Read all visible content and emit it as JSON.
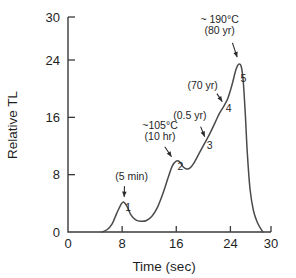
{
  "chart_data": {
    "type": "line",
    "title": "",
    "xlabel": "Time (sec)",
    "ylabel": "Relative TL",
    "xlim": [
      0,
      30
    ],
    "ylim": [
      0,
      30
    ],
    "xticks": [
      0,
      8,
      16,
      24,
      30
    ],
    "yticks": [
      0,
      8,
      16,
      24,
      30
    ],
    "xtick_labels": [
      "0",
      "8",
      "16",
      "24",
      "30"
    ],
    "ytick_labels": [
      "0",
      "8",
      "16",
      "24",
      "30"
    ],
    "grid": false,
    "legend": "none",
    "series": [
      {
        "name": "glow-curve",
        "x": [
          5.0,
          5.8,
          6.5,
          7.2,
          7.8,
          8.2,
          8.7,
          9.3,
          10.0,
          10.8,
          11.6,
          12.4,
          13.2,
          14.0,
          14.8,
          15.4,
          16.0,
          16.5,
          17.0,
          17.5,
          18.0,
          18.6,
          19.4,
          20.2,
          21.0,
          21.8,
          22.4,
          23.0,
          23.6,
          24.2,
          24.8,
          25.2,
          25.6,
          25.9,
          26.2,
          26.5,
          26.9,
          27.4,
          28.0,
          28.8
        ],
        "y": [
          0.0,
          0.35,
          1.1,
          2.6,
          3.8,
          4.2,
          3.6,
          2.4,
          1.7,
          1.5,
          1.6,
          2.2,
          3.4,
          5.3,
          7.6,
          9.2,
          9.9,
          9.8,
          9.1,
          8.8,
          8.9,
          9.6,
          11.0,
          12.4,
          13.8,
          15.4,
          16.6,
          17.5,
          18.6,
          20.4,
          22.6,
          23.4,
          23.1,
          21.0,
          16.5,
          11.0,
          6.0,
          3.0,
          1.3,
          0.0
        ]
      }
    ],
    "peaks": [
      {
        "id": "1",
        "label": "1",
        "x": 8.2,
        "y": 4.2,
        "label_x": 8.45,
        "label_y": 2.9
      },
      {
        "id": "2",
        "label": "2",
        "x": 16.0,
        "y": 9.9,
        "label_x": 16.2,
        "label_y": 8.6
      },
      {
        "id": "3",
        "label": "3",
        "x": 20.2,
        "y": 12.4,
        "label_x": 20.5,
        "label_y": 11.6
      },
      {
        "id": "4",
        "label": "4",
        "x": 23.0,
        "y": 17.5,
        "label_x": 23.3,
        "label_y": 16.7
      },
      {
        "id": "5",
        "label": "5",
        "x": 25.2,
        "y": 23.4,
        "label_x": 25.5,
        "label_y": 21.0
      }
    ],
    "annotations": [
      {
        "id": "peak1-annotation",
        "lines": [
          "(5 min)"
        ],
        "text_x": 9.4,
        "text_y": 7.2,
        "arrow_from_x": 8.35,
        "arrow_from_y": 6.4,
        "arrow_to_x": 8.3,
        "arrow_to_y": 4.9
      },
      {
        "id": "peak2-annotation",
        "lines": [
          "~105°C",
          "(10 hr)"
        ],
        "text_x": 13.6,
        "text_y": 14.4,
        "arrow_from_x": 14.3,
        "arrow_from_y": 11.9,
        "arrow_to_x": 15.3,
        "arrow_to_y": 10.5
      },
      {
        "id": "peak3-annotation",
        "lines": [
          "(0.5 yr)"
        ],
        "text_x": 18.0,
        "text_y": 15.8,
        "arrow_from_x": 19.6,
        "arrow_from_y": 14.7,
        "arrow_to_x": 20.2,
        "arrow_to_y": 13.3
      },
      {
        "id": "peak4-annotation",
        "lines": [
          "(70 yr)"
        ],
        "text_x": 19.9,
        "text_y": 19.9,
        "arrow_from_x": 22.0,
        "arrow_from_y": 19.3,
        "arrow_to_x": 22.8,
        "arrow_to_y": 18.2
      },
      {
        "id": "peak5-annotation",
        "lines": [
          "~ 190°C",
          "(80 yr)"
        ],
        "text_x": 22.4,
        "text_y": 29.2,
        "arrow_from_x": 24.3,
        "arrow_from_y": 26.4,
        "arrow_to_x": 25.0,
        "arrow_to_y": 24.4
      }
    ]
  }
}
